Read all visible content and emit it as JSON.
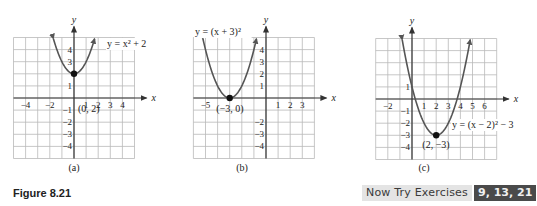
{
  "figure": {
    "label": "Figure 8.21",
    "now_try": {
      "label": "Now Try Exercises",
      "exercises": "9, 13, 21"
    }
  },
  "chart_data": [
    {
      "type": "line",
      "subcaption": "(a)",
      "equation": "y = x² + 2",
      "function": {
        "a": 1,
        "h": 0,
        "k": 2
      },
      "vertex": {
        "x": 0,
        "y": 2,
        "label": "(0, 2)"
      },
      "xlabel": "x",
      "ylabel": "y",
      "xlim": [
        -5,
        5
      ],
      "ylim": [
        -5,
        5
      ],
      "x_tick_labels": [
        "-4",
        "-2",
        "1",
        "2",
        "3",
        "4"
      ],
      "x_ticks": [
        -4,
        -2,
        1,
        2,
        3,
        4
      ],
      "y_tick_labels": [
        "4",
        "3",
        "1",
        "-1",
        "-2",
        "-3",
        "-4"
      ],
      "y_ticks": [
        4,
        3,
        1,
        -1,
        -2,
        -3,
        -4
      ],
      "grid": true
    },
    {
      "type": "line",
      "subcaption": "(b)",
      "equation": "y = (x + 3)²",
      "function": {
        "a": 1,
        "h": -3,
        "k": 0
      },
      "vertex": {
        "x": -3,
        "y": 0,
        "label": "(−3, 0)"
      },
      "xlabel": "x",
      "ylabel": "y",
      "xlim": [
        -6,
        4
      ],
      "ylim": [
        -5,
        5
      ],
      "x_tick_labels": [
        "-5",
        "1",
        "2",
        "3"
      ],
      "x_ticks": [
        -5,
        1,
        2,
        3
      ],
      "y_tick_labels": [
        "4",
        "3",
        "2",
        "1",
        "-2",
        "-3",
        "-4"
      ],
      "y_ticks": [
        4,
        3,
        2,
        1,
        -2,
        -3,
        -4
      ],
      "grid": true
    },
    {
      "type": "line",
      "subcaption": "(c)",
      "equation": "y = (x − 2)² − 3",
      "function": {
        "a": 1,
        "h": 2,
        "k": -3
      },
      "vertex": {
        "x": 2,
        "y": -3,
        "label": "(2, −3)"
      },
      "xlabel": "x",
      "ylabel": "y",
      "xlim": [
        -3,
        7
      ],
      "ylim": [
        -5,
        5
      ],
      "x_tick_labels": [
        "-2",
        "1",
        "2",
        "3",
        "4",
        "5",
        "6"
      ],
      "x_ticks": [
        -2,
        1,
        2,
        3,
        4,
        5,
        6
      ],
      "y_tick_labels": [
        "1",
        "-1",
        "-2",
        "-3",
        "-4"
      ],
      "y_ticks": [
        1,
        -1,
        -2,
        -3,
        -4
      ],
      "grid": true
    }
  ]
}
